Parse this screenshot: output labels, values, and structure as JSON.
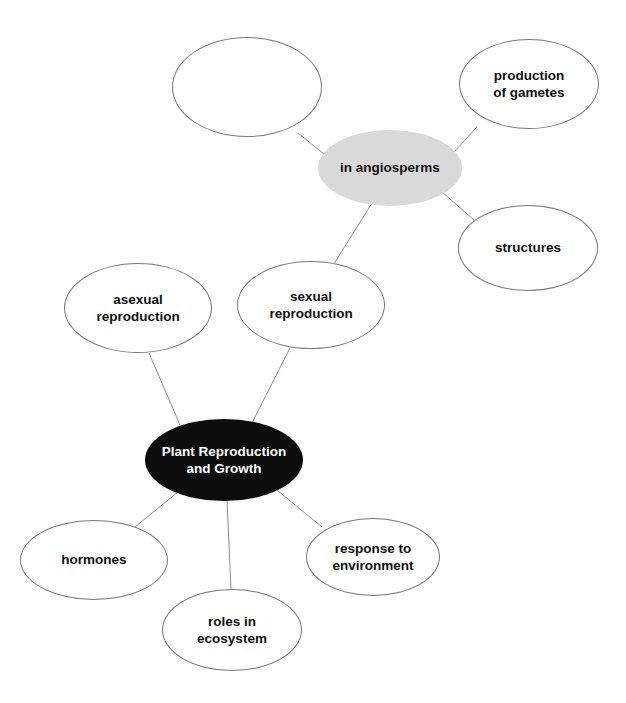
{
  "diagram": {
    "type": "mind-map",
    "background_color": "#ffffff",
    "edge_color": "#8b8d90",
    "canvas": {
      "width": 626,
      "height": 703
    }
  },
  "nodes": [
    {
      "id": "blank-topic",
      "label": "",
      "style": "outline",
      "fill": "#ffffff",
      "stroke": "#77797c",
      "text_color": "#101010",
      "x": 247,
      "y": 87,
      "w": 150,
      "h": 100
    },
    {
      "id": "production-of-gametes",
      "label": "production\nof gametes",
      "style": "outline",
      "fill": "#ffffff",
      "stroke": "#77797c",
      "text_color": "#101010",
      "x": 529,
      "y": 84,
      "w": 140,
      "h": 90
    },
    {
      "id": "in-angiosperms",
      "label": "in angiosperms",
      "style": "filled-gray",
      "fill": "#d9d9d9",
      "stroke": "none",
      "text_color": "#101010",
      "x": 390,
      "y": 168,
      "w": 144,
      "h": 76
    },
    {
      "id": "structures",
      "label": "structures",
      "style": "outline",
      "fill": "#ffffff",
      "stroke": "#77797c",
      "text_color": "#101010",
      "x": 528,
      "y": 248,
      "w": 140,
      "h": 86
    },
    {
      "id": "sexual-reproduction",
      "label": "sexual\nreproduction",
      "style": "outline",
      "fill": "#ffffff",
      "stroke": "#77797c",
      "text_color": "#101010",
      "x": 311,
      "y": 305,
      "w": 148,
      "h": 88
    },
    {
      "id": "asexual-reproduction",
      "label": "asexual\nreproduction",
      "style": "outline",
      "fill": "#ffffff",
      "stroke": "#77797c",
      "text_color": "#101010",
      "x": 138,
      "y": 308,
      "w": 148,
      "h": 90
    },
    {
      "id": "plant-reproduction-and-growth",
      "label": "Plant Reproduction\nand Growth",
      "style": "filled-black",
      "fill": "#0d0d0d",
      "stroke": "none",
      "text_color": "#ffffff",
      "x": 224,
      "y": 460,
      "w": 158,
      "h": 82
    },
    {
      "id": "hormones",
      "label": "hormones",
      "style": "outline",
      "fill": "#ffffff",
      "stroke": "#77797c",
      "text_color": "#101010",
      "x": 94,
      "y": 560,
      "w": 148,
      "h": 80
    },
    {
      "id": "roles-in-ecosystem",
      "label": "roles in\necosystem",
      "style": "outline",
      "fill": "#ffffff",
      "stroke": "#77797c",
      "text_color": "#101010",
      "x": 232,
      "y": 630,
      "w": 140,
      "h": 82
    },
    {
      "id": "response-to-environment",
      "label": "response to\nenvironment",
      "style": "outline",
      "fill": "#ffffff",
      "stroke": "#77797c",
      "text_color": "#101010",
      "x": 373,
      "y": 557,
      "w": 134,
      "h": 78
    }
  ],
  "edges": [
    {
      "id": "edge-center-asexual",
      "from": "plant-reproduction-and-growth",
      "to": "asexual-reproduction",
      "x1": 180,
      "y1": 425,
      "x2": 149,
      "y2": 353
    },
    {
      "id": "edge-center-sexual",
      "from": "plant-reproduction-and-growth",
      "to": "sexual-reproduction",
      "x1": 252,
      "y1": 423,
      "x2": 290,
      "y2": 348
    },
    {
      "id": "edge-center-hormones",
      "from": "plant-reproduction-and-growth",
      "to": "hormones",
      "x1": 178,
      "y1": 492,
      "x2": 135,
      "y2": 527
    },
    {
      "id": "edge-center-roles",
      "from": "plant-reproduction-and-growth",
      "to": "roles-in-ecosystem",
      "x1": 227,
      "y1": 500,
      "x2": 231,
      "y2": 590
    },
    {
      "id": "edge-center-response",
      "from": "plant-reproduction-and-growth",
      "to": "response-to-environment",
      "x1": 277,
      "y1": 490,
      "x2": 322,
      "y2": 527
    },
    {
      "id": "edge-sexual-angiosperms",
      "from": "sexual-reproduction",
      "to": "in-angiosperms",
      "x1": 332,
      "y1": 267,
      "x2": 372,
      "y2": 203
    },
    {
      "id": "edge-angiosperms-blank",
      "from": "in-angiosperms",
      "to": "blank-topic",
      "x1": 340,
      "y1": 167,
      "x2": 298,
      "y2": 133
    },
    {
      "id": "edge-angiosperms-gametes",
      "from": "in-angiosperms",
      "to": "production-of-gametes",
      "x1": 441,
      "y1": 166,
      "x2": 477,
      "y2": 127
    },
    {
      "id": "edge-angiosperms-structures",
      "from": "in-angiosperms",
      "to": "structures",
      "x1": 442,
      "y1": 192,
      "x2": 482,
      "y2": 227
    }
  ]
}
